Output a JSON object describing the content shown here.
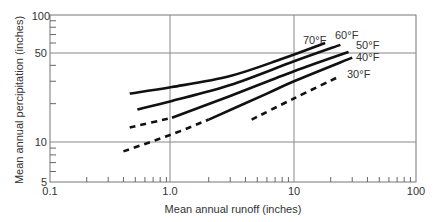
{
  "chart_data": {
    "type": "line",
    "title": "",
    "xlabel": "Mean annual runoff (inches)",
    "ylabel": "Mean annual percipitation (inches)",
    "x_scale": "log",
    "y_scale": "log",
    "xlim": [
      0.1,
      100
    ],
    "ylim": [
      5,
      100
    ],
    "x_tick_labels": [
      "0.1",
      "1.0",
      "10",
      "100"
    ],
    "y_tick_labels": [
      "5",
      "10",
      "50",
      "100"
    ],
    "grid": {
      "x": [
        1,
        10
      ],
      "y": [
        10,
        50
      ]
    },
    "series": [
      {
        "name": "70°F",
        "style": "solid",
        "points": [
          [
            0.45,
            24
          ],
          [
            1.0,
            27
          ],
          [
            3.0,
            33
          ],
          [
            8.0,
            45
          ],
          [
            18.0,
            60
          ]
        ]
      },
      {
        "name": "60°F",
        "style": "solid",
        "points": [
          [
            0.52,
            18
          ],
          [
            1.0,
            21
          ],
          [
            3.0,
            28
          ],
          [
            10.0,
            43
          ],
          [
            24.0,
            58
          ]
        ]
      },
      {
        "name": "50°F",
        "style": "mixed",
        "dashed_until": 1.0,
        "points": [
          [
            0.45,
            13
          ],
          [
            1.0,
            15.5
          ],
          [
            3.0,
            23
          ],
          [
            10.0,
            36
          ],
          [
            28.0,
            51
          ]
        ]
      },
      {
        "name": "40°F",
        "style": "mixed",
        "dashed_until": 2.0,
        "points": [
          [
            0.4,
            8.5
          ],
          [
            1.0,
            11.5
          ],
          [
            2.0,
            15
          ],
          [
            6.0,
            24
          ],
          [
            10.0,
            30
          ],
          [
            30.0,
            46
          ]
        ]
      },
      {
        "name": "30°F",
        "style": "dashed",
        "points": [
          [
            4.5,
            15
          ],
          [
            10.0,
            22
          ],
          [
            24.0,
            33
          ]
        ]
      }
    ],
    "legend": "inline labels at line ends"
  }
}
